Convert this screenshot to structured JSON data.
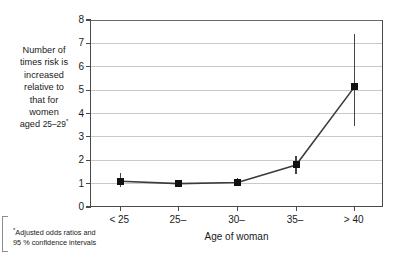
{
  "chart_data": {
    "type": "line",
    "title": "",
    "subtitle": "",
    "xlabel": "Age of woman",
    "ylabel": "Number of times risk is increased relative to that for women aged 25–29*",
    "categories": [
      "< 25",
      "25–",
      "30–",
      "35–",
      "> 40"
    ],
    "values": [
      1.1,
      1.0,
      1.05,
      1.8,
      5.15
    ],
    "error_low": [
      0.85,
      1.0,
      0.9,
      1.4,
      3.45
    ],
    "error_high": [
      1.45,
      1.0,
      1.25,
      2.2,
      7.4
    ],
    "series": [
      {
        "name": "Adjusted odds ratio",
        "values": [
          1.1,
          1.0,
          1.05,
          1.8,
          5.15
        ]
      }
    ],
    "ylim": [
      0,
      8
    ],
    "yticks": [
      0,
      1,
      2,
      3,
      4,
      5,
      6,
      7,
      8
    ],
    "ytick_labels": [
      "0",
      "1",
      "2",
      "3",
      "4",
      "5",
      "6",
      "7",
      "8"
    ],
    "grid": true,
    "legend": "none",
    "marker": "square",
    "errorbars": "95 % confidence intervals",
    "annotation": "*Adjusted odds ratios and 95 % confidence intervals"
  },
  "axis": {
    "y_title_lines": [
      "Number of",
      "times risk is",
      "increased",
      "relative to",
      "that for",
      "women"
    ],
    "y_title_last_prefix": "aged ",
    "y_title_last_range": "25–29",
    "y_title_marker": "*",
    "x_title": "Age of woman"
  },
  "footnote": {
    "marker": "*",
    "line1": "Adjusted odds ratios and",
    "line2": "95 % confidence intervals"
  },
  "colors": {
    "marker": "#111111",
    "line": "#3b3b3b",
    "grid": "#c9c9c9",
    "axis": "#4a4a4a",
    "background": "#ffffff",
    "text": "#1a1a1a"
  }
}
